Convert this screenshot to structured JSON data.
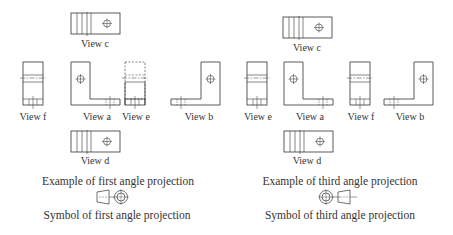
{
  "panels": [
    {
      "name": "first-angle",
      "views": {
        "c": "View c",
        "f": "View f",
        "a": "View a",
        "e": "View e",
        "b": "View b",
        "d": "View d"
      },
      "caption": "Example of first angle projection",
      "symbol_caption": "Symbol of first angle projection"
    },
    {
      "name": "third-angle",
      "views": {
        "c": "View c",
        "e": "View e",
        "a": "View a",
        "f": "View f",
        "b": "View b",
        "d": "View d"
      },
      "caption": "Example of third angle projection",
      "symbol_caption": "Symbol of third angle projection"
    }
  ],
  "colors": {
    "line": "#333333",
    "text": "#333333",
    "background": "#ffffff"
  }
}
